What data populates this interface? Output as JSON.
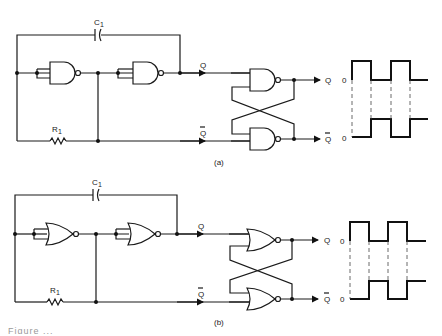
{
  "figure": {
    "panels": [
      {
        "id": "a",
        "label": "(a)",
        "gate_type": "NAND",
        "components": {
          "capacitor": "C",
          "capacitor_sub": "1",
          "resistor": "R",
          "resistor_sub": "1"
        },
        "signals": {
          "q": "Q",
          "q_bar": "Q",
          "q_out": "Q",
          "q_bar_out": "Q"
        },
        "waveform": {
          "zero_label_top": "0",
          "zero_label_bottom": "0"
        }
      },
      {
        "id": "b",
        "label": "(b)",
        "gate_type": "NOR",
        "components": {
          "capacitor": "C",
          "capacitor_sub": "1",
          "resistor": "R",
          "resistor_sub": "1"
        },
        "signals": {
          "q": "Q",
          "q_bar": "Q",
          "q_out": "Q",
          "q_bar_out": "Q"
        },
        "waveform": {
          "zero_label_top": "0",
          "zero_label_bottom": "0"
        }
      }
    ],
    "caption_fragment": "Figure ..."
  }
}
